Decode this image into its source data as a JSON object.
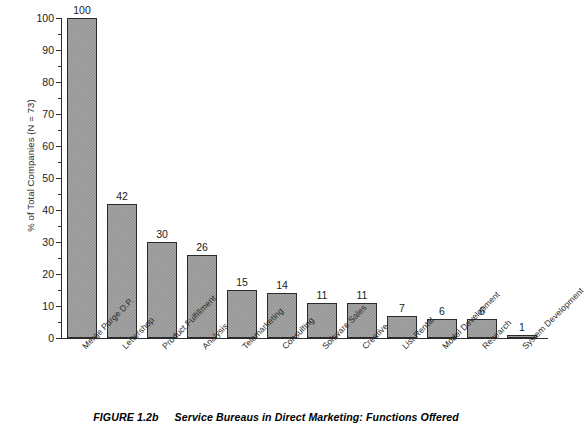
{
  "chart_data": {
    "type": "bar",
    "title": "",
    "xlabel": "",
    "ylabel": "% of Total Companies (N = 73)",
    "ylim": [
      0,
      100
    ],
    "ytick_step": 10,
    "yminor_step": 5,
    "grid": false,
    "legend": "none",
    "bar_fill": "#a6a6a6",
    "bar_edge": "#2b2b2b",
    "value_labels": true,
    "xtick_rotation": -45,
    "categories": [
      "Merge Purge D.P.",
      "Lettershop",
      "Product Fulfillment",
      "Analysis",
      "Telemarketing",
      "Consulting",
      "Software Sales",
      "Creative",
      "List Rental",
      "Model Development",
      "Research",
      "System Development"
    ],
    "values": [
      100,
      42,
      30,
      26,
      15,
      14,
      11,
      11,
      7,
      6,
      6,
      1
    ],
    "yticks": [
      "0",
      "10",
      "20",
      "30",
      "40",
      "50",
      "60",
      "70",
      "80",
      "90",
      "100"
    ]
  },
  "caption": {
    "number": "FIGURE 1.2b",
    "text": "Service Bureaus in Direct Marketing: Functions Offered"
  }
}
